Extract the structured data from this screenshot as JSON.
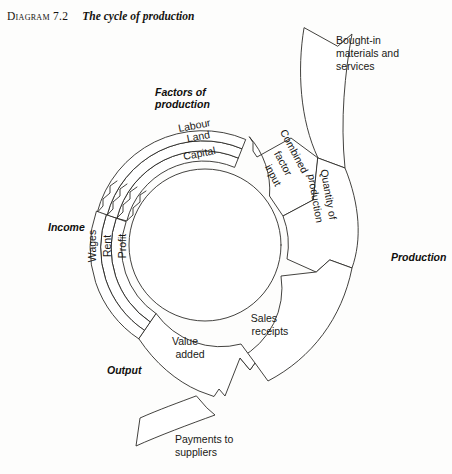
{
  "title": {
    "number": "Diagram 7.2",
    "caption": "The cycle of production"
  },
  "diagram": {
    "type": "cycle-flow-diagram",
    "center": {
      "x": 205,
      "y": 245
    },
    "ink_color": "#2e2c29",
    "background": "#fdfdfc",
    "section_labels": {
      "factors_of_production": "Factors of\nproduction",
      "factors_line1": "Factors of",
      "factors_line2": "production",
      "income": "Income",
      "output": "Output",
      "production": "Production"
    },
    "inner_bands": [
      {
        "name": "labour",
        "label": "Labour"
      },
      {
        "name": "land",
        "label": "Land"
      },
      {
        "name": "capital",
        "label": "Capital"
      }
    ],
    "income_bands": [
      {
        "name": "wages",
        "label": "Wages"
      },
      {
        "name": "rent",
        "label": "Rent"
      },
      {
        "name": "profit",
        "label": "Profit"
      }
    ],
    "segments": [
      {
        "name": "combined-factor-input",
        "label": "Combined factor input",
        "line1": "Combined",
        "line2": "factor",
        "line3": "input"
      },
      {
        "name": "quantity-of-production",
        "label": "Quantity of production",
        "line1": "Quantity of",
        "line2": "production"
      },
      {
        "name": "sales-receipts",
        "label": "Sales receipts",
        "line1": "Sales",
        "line2": "receipts"
      },
      {
        "name": "value-added",
        "label": "Value added",
        "line1": "Value",
        "line2": "added"
      }
    ],
    "external_flows": [
      {
        "name": "bought-in-materials",
        "label": "Bought-in materials and services",
        "line1": "Bought-in",
        "line2": "materials and",
        "line3": "services",
        "direction": "outward-up-right"
      },
      {
        "name": "payments-to-suppliers",
        "label": "Payments to suppliers",
        "line1": "Payments to",
        "line2": "suppliers",
        "direction": "outward-down-left"
      }
    ]
  }
}
